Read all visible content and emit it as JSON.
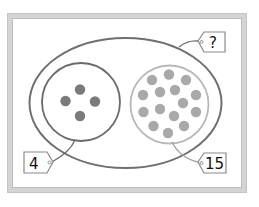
{
  "diagram": {
    "type": "part-whole set diagram",
    "whole": {
      "label": "?",
      "shape": "ellipse",
      "stroke": "#6f6f6f"
    },
    "parts": [
      {
        "label": "4",
        "count": 4,
        "dot_color": "#7a7a7a",
        "stroke": "#6a6a6a"
      },
      {
        "label": "15",
        "count": 15,
        "dot_color": "#a9a9a9",
        "stroke": "#b8b8b8"
      }
    ],
    "frame_color": "#d4d4d4"
  }
}
